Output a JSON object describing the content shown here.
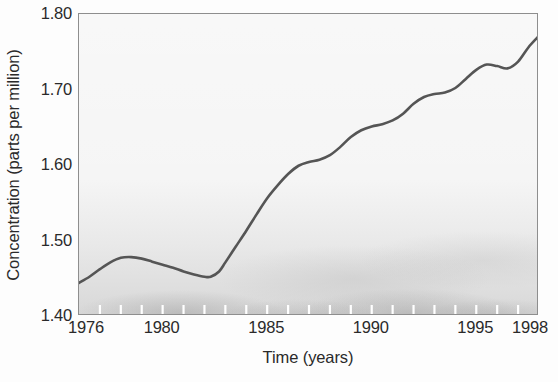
{
  "chart_data": {
    "type": "line",
    "title": "",
    "xlabel": "Time (years)",
    "ylabel": "Concentration (parts per million)",
    "xlim": [
      1976,
      1998
    ],
    "ylim": [
      1.4,
      1.8
    ],
    "grid": false,
    "legend": null,
    "xticklabels": [
      "1976",
      "1980",
      "1985",
      "1990",
      "1995",
      "1998"
    ],
    "xticks": [
      1976,
      1980,
      1985,
      1990,
      1995,
      1998
    ],
    "xminorticks": [
      1976,
      1977,
      1978,
      1979,
      1980,
      1981,
      1982,
      1983,
      1984,
      1985,
      1986,
      1987,
      1988,
      1989,
      1990,
      1991,
      1992,
      1993,
      1994,
      1995,
      1996,
      1997,
      1998
    ],
    "yticklabels": [
      "1.40",
      "1.50",
      "1.60",
      "1.70",
      "1.80"
    ],
    "yticks": [
      1.4,
      1.5,
      1.6,
      1.7,
      1.8
    ],
    "series": [
      {
        "name": "Concentration",
        "color": "#555555",
        "x": [
          1976.0,
          1976.5,
          1977.0,
          1977.5,
          1978.0,
          1978.5,
          1979.0,
          1979.5,
          1980.0,
          1980.5,
          1981.0,
          1981.5,
          1982.0,
          1982.3,
          1982.7,
          1983.0,
          1983.5,
          1984.0,
          1984.5,
          1985.0,
          1985.5,
          1986.0,
          1986.5,
          1987.0,
          1987.5,
          1988.0,
          1988.5,
          1989.0,
          1989.5,
          1990.0,
          1990.5,
          1991.0,
          1991.5,
          1992.0,
          1992.5,
          1993.0,
          1993.5,
          1994.0,
          1994.5,
          1995.0,
          1995.5,
          1996.0,
          1996.5,
          1997.0,
          1997.5,
          1998.0
        ],
        "y": [
          1.444,
          1.452,
          1.462,
          1.471,
          1.477,
          1.478,
          1.476,
          1.472,
          1.468,
          1.464,
          1.459,
          1.455,
          1.452,
          1.452,
          1.459,
          1.471,
          1.492,
          1.513,
          1.535,
          1.556,
          1.573,
          1.588,
          1.599,
          1.604,
          1.607,
          1.613,
          1.624,
          1.637,
          1.646,
          1.651,
          1.654,
          1.659,
          1.668,
          1.681,
          1.69,
          1.694,
          1.696,
          1.702,
          1.714,
          1.726,
          1.733,
          1.731,
          1.728,
          1.737,
          1.756,
          1.771
        ]
      }
    ]
  },
  "axes": {
    "ylabel_text": "Concentration (parts per million)",
    "xlabel_text": "Time (years)"
  }
}
